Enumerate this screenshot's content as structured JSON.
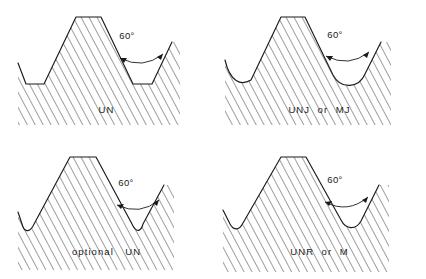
{
  "figure": {
    "background_color": "#ffffff",
    "line_color": "#1a1a1a",
    "hatch_color": "#1a1a1a",
    "panel_count": 4
  },
  "panels": [
    {
      "id": "un",
      "caption": "UN",
      "angle_label": "60°",
      "crest": "flat",
      "root": "flat",
      "position": "top-left"
    },
    {
      "id": "unj-mj",
      "caption": "UNJ  or  MJ",
      "angle_label": "60°",
      "crest": "flat",
      "root": "rounded-large-radius",
      "position": "top-right"
    },
    {
      "id": "optional-un",
      "caption": "optional   UN",
      "angle_label": "60°",
      "crest": "flat",
      "root": "rounded-small-radius",
      "position": "bottom-left"
    },
    {
      "id": "unr-m",
      "caption": "UNR  or  M",
      "angle_label": "60°",
      "crest": "flat",
      "root": "rounded-medium-radius",
      "position": "bottom-right"
    }
  ]
}
